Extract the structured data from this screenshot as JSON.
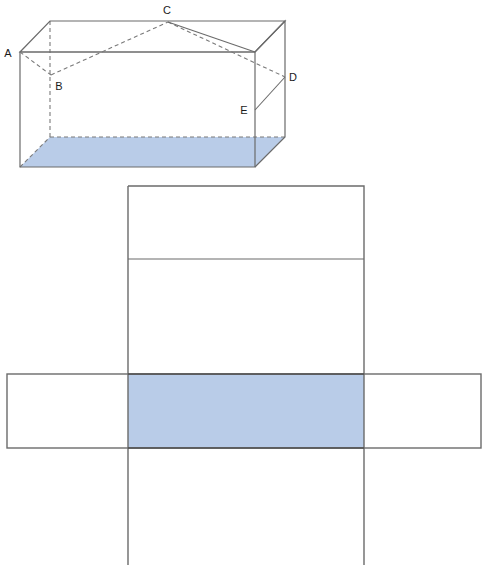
{
  "figure": {
    "colors": {
      "shaded_fill": "#b9cce8",
      "stroke": "#6b6b6b",
      "stroke_dark": "#4f4f4f",
      "hidden_edge": "#7a7a7a",
      "label_text": "#1a1a1a",
      "background": "#ffffff"
    },
    "solid": {
      "name": "rectangular-prism",
      "labels": [
        {
          "id": "A",
          "text": "A",
          "x": 11,
          "y": 56
        },
        {
          "id": "B",
          "text": "B",
          "x": 57,
          "y": 88
        },
        {
          "id": "C",
          "text": "C",
          "x": 164,
          "y": 14
        },
        {
          "id": "D",
          "text": "D",
          "x": 289,
          "y": 81
        },
        {
          "id": "E",
          "text": "E",
          "x": 240,
          "y": 115
        }
      ],
      "vertices": {
        "front_top_left": [
          20,
          52
        ],
        "front_top_right": [
          255,
          52
        ],
        "front_bottom_left": [
          20,
          167
        ],
        "front_bottom_right": [
          255,
          167
        ],
        "back_top_left": [
          50,
          21
        ],
        "back_top_right": [
          285,
          21
        ],
        "back_bottom_left": [
          50,
          137
        ],
        "back_bottom_right": [
          285,
          137
        ]
      },
      "shaded_face": "bottom",
      "hidden_edges": [
        "back_top_left-back_bottom_left",
        "back_bottom_left-back_bottom_right",
        "A-B",
        "B-C",
        "C-D"
      ],
      "marked_path": [
        "A",
        "B",
        "C",
        "D",
        "E"
      ]
    },
    "net": {
      "name": "unfolded-net",
      "vertical_strip": {
        "x": 128,
        "y": 186,
        "width": 236,
        "height": 379
      },
      "horizontal_strip": {
        "x": 7,
        "y": 374,
        "width": 474,
        "height": 74
      },
      "fold_line_y": 259,
      "shaded_panel": {
        "x": 128,
        "y": 374,
        "width": 236,
        "height": 74
      }
    }
  }
}
